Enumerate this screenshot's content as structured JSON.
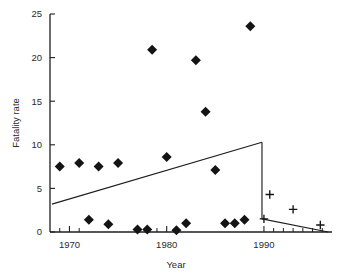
{
  "chart_data": {
    "type": "scatter",
    "title": "",
    "subtitle": "",
    "xlabel": "Year",
    "ylabel": "Fatality rate",
    "xlim": [
      1968,
      1997
    ],
    "ylim": [
      0,
      25
    ],
    "grid": false,
    "legend": "none",
    "x_ticks_major": [
      1970,
      1980,
      1990
    ],
    "x_tick_labels": [
      "1970",
      "1980",
      "1990"
    ],
    "x_ticks_minor": [
      1969,
      1971,
      1979,
      1981,
      1991,
      1992,
      1993,
      1994,
      1995,
      1996
    ],
    "y_ticks": [
      0,
      5,
      10,
      15,
      20,
      25
    ],
    "y_tick_labels": [
      "0",
      "5",
      "10",
      "15",
      "20",
      "25"
    ],
    "series": [
      {
        "name": "diamond-series",
        "marker": "diamond",
        "color": "#141414",
        "points": [
          {
            "x": 1969,
            "y": 7.5
          },
          {
            "x": 1971,
            "y": 7.9
          },
          {
            "x": 1972,
            "y": 1.4
          },
          {
            "x": 1973,
            "y": 7.5
          },
          {
            "x": 1974,
            "y": 0.9
          },
          {
            "x": 1975,
            "y": 7.9
          },
          {
            "x": 1977,
            "y": 0.3
          },
          {
            "x": 1978,
            "y": 0.3
          },
          {
            "x": 1978.5,
            "y": 20.9
          },
          {
            "x": 1980,
            "y": 8.6
          },
          {
            "x": 1981,
            "y": 0.2
          },
          {
            "x": 1982,
            "y": 1.0
          },
          {
            "x": 1983,
            "y": 19.7
          },
          {
            "x": 1984,
            "y": 13.8
          },
          {
            "x": 1985,
            "y": 7.1
          },
          {
            "x": 1986,
            "y": 1.0
          },
          {
            "x": 1987,
            "y": 1.0
          },
          {
            "x": 1988,
            "y": 1.4
          },
          {
            "x": 1988.6,
            "y": 23.6
          }
        ]
      },
      {
        "name": "plus-series",
        "marker": "plus",
        "color": "#141414",
        "points": [
          {
            "x": 1990.0,
            "y": 1.5
          },
          {
            "x": 1990.6,
            "y": 4.3
          },
          {
            "x": 1993.0,
            "y": 2.6
          },
          {
            "x": 1995.8,
            "y": 0.8
          }
        ]
      }
    ],
    "trend_lines": [
      {
        "name": "pre-1990-trend",
        "points": [
          {
            "x": 1968.2,
            "y": 3.2
          },
          {
            "x": 1989.8,
            "y": 10.3
          }
        ]
      },
      {
        "name": "vertical-drop",
        "points": [
          {
            "x": 1989.8,
            "y": 10.3
          },
          {
            "x": 1989.8,
            "y": 1.5
          }
        ]
      },
      {
        "name": "post-1990-trend",
        "points": [
          {
            "x": 1989.8,
            "y": 1.5
          },
          {
            "x": 1996.6,
            "y": 0.0
          }
        ]
      }
    ]
  }
}
